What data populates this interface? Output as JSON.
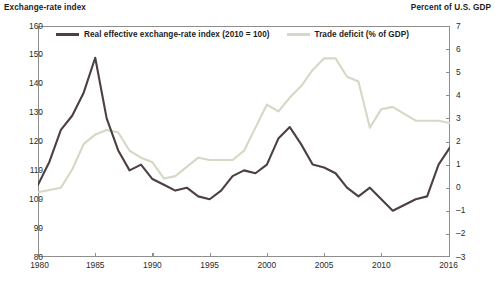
{
  "header": {
    "left_label": "Exchange-rate index",
    "right_label": "Percent of U.S. GDP"
  },
  "legend": {
    "position": "top-inside",
    "items": [
      {
        "label": "Real effective exchange-rate index (2010 = 100)",
        "color": "#4d3f42",
        "axis": "left"
      },
      {
        "label": "Trade deficit (% of GDP)",
        "color": "#d6d7c4",
        "axis": "right"
      }
    ]
  },
  "axes": {
    "left": {
      "title": "Exchange-rate index",
      "min": 80,
      "max": 160,
      "step": 10,
      "ticks": [
        "80",
        "90",
        "100",
        "110",
        "120",
        "130",
        "140",
        "150",
        "160"
      ]
    },
    "right": {
      "title": "Percent of U.S. GDP",
      "min": -3,
      "max": 7,
      "step": 1,
      "ticks": [
        "-3",
        "-2",
        "-1",
        "0",
        "1",
        "2",
        "3",
        "4",
        "5",
        "6",
        "7"
      ]
    },
    "x": {
      "min": 1980,
      "max": 2016,
      "ticks": [
        "1980",
        "1985",
        "1990",
        "1995",
        "2000",
        "2005",
        "2010",
        "2016"
      ],
      "tick_values": [
        1980,
        1985,
        1990,
        1995,
        2000,
        2005,
        2010,
        2016
      ]
    }
  },
  "chart_data": {
    "type": "line",
    "title": "",
    "xlabel": "",
    "ylabel": "Exchange-rate index",
    "y2label": "Percent of U.S. GDP",
    "xlim": [
      1980,
      2016
    ],
    "ylim": [
      80,
      160
    ],
    "y2lim": [
      -3,
      7
    ],
    "grid": false,
    "legend_position": "top-inside",
    "x": [
      1980,
      1981,
      1982,
      1983,
      1984,
      1985,
      1986,
      1987,
      1988,
      1989,
      1990,
      1991,
      1992,
      1993,
      1994,
      1995,
      1996,
      1997,
      1998,
      1999,
      2000,
      2001,
      2002,
      2003,
      2004,
      2005,
      2006,
      2007,
      2008,
      2009,
      2010,
      2011,
      2012,
      2013,
      2014,
      2015,
      2016
    ],
    "series": [
      {
        "name": "Real effective exchange-rate index (2010 = 100)",
        "axis": "left",
        "color": "#4d3f42",
        "values": [
          105,
          113,
          124,
          129,
          137,
          149,
          128,
          117,
          110,
          112,
          107,
          105,
          103,
          104,
          101,
          100,
          103,
          108,
          110,
          109,
          112,
          121,
          125,
          119,
          112,
          111,
          109,
          104,
          101,
          104,
          100,
          96,
          98,
          100,
          101,
          112,
          118
        ]
      },
      {
        "name": "Trade deficit (% of GDP)",
        "axis": "right",
        "color": "#d6d7c4",
        "values": [
          -0.2,
          -0.1,
          0.0,
          0.8,
          1.9,
          2.3,
          2.5,
          2.4,
          1.6,
          1.3,
          1.1,
          0.4,
          0.5,
          0.9,
          1.3,
          1.2,
          1.2,
          1.2,
          1.6,
          2.6,
          3.6,
          3.3,
          3.9,
          4.4,
          5.1,
          5.6,
          5.6,
          4.8,
          4.6,
          2.6,
          3.4,
          3.5,
          3.2,
          2.9,
          2.9,
          2.9,
          2.8
        ]
      }
    ]
  }
}
